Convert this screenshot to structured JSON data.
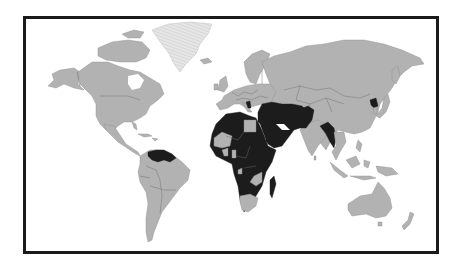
{
  "map": {
    "type": "world-choropleth",
    "projection": "equirectangular-style",
    "colors": {
      "background": "#ffffff",
      "frame": "#1a1a1a",
      "land_default": "#b2b2b2",
      "land_highlighted": "#1c1c1c",
      "greenland_pattern": "#e0e0e0",
      "borders": "#6e6e6e"
    },
    "highlighted_regions": [
      "Venezuela",
      "Guyana",
      "Suriname",
      "Morocco/Western Sahara",
      "Algeria",
      "Tunisia",
      "Libya",
      "Sudan",
      "Chad",
      "Niger",
      "West Africa (Senegal, Guinea, Sierra Leone, Liberia, Côte d'Ivoire, Burkina Faso, Nigeria)",
      "Central Africa (Cameroon, CAR, Congo, DRC, Gabon)",
      "East Africa (Ethiopia, Eritrea, Somalia, Kenya, Uganda, Tanzania)",
      "Southern Africa (Angola, Zimbabwe, Mozambique)",
      "Madagascar",
      "Syria",
      "Iraq",
      "Iran",
      "Saudi Arabia",
      "Yemen",
      "Oman",
      "Jordan",
      "Afghanistan",
      "Pakistan",
      "Bangladesh",
      "Myanmar",
      "North Korea",
      "Bosnia and Herzegovina / Albania"
    ],
    "non_highlighted_notes": [
      "Egypt (gray)",
      "Mali/Mauritania (gray)",
      "South Africa (gray)",
      "Namibia/Botswana/Zambia (gray)",
      "Greenland (striped / no data)"
    ]
  }
}
